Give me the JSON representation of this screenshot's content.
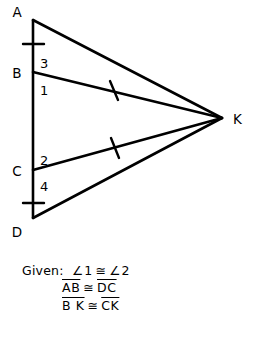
{
  "figure": {
    "vertices": [
      {
        "id": "A",
        "label": "A",
        "x": 33,
        "y": 20,
        "label_x": 17,
        "label_y": 17
      },
      {
        "id": "B",
        "label": "B",
        "x": 33,
        "y": 72,
        "label_x": 17,
        "label_y": 77
      },
      {
        "id": "C",
        "label": "C",
        "x": 33,
        "y": 170,
        "label_x": 17,
        "label_y": 175
      },
      {
        "id": "D",
        "label": "D",
        "x": 33,
        "y": 218,
        "label_x": 17,
        "label_y": 235
      },
      {
        "id": "K",
        "label": "K",
        "x": 222,
        "y": 118,
        "label_x": 233,
        "label_y": 123
      }
    ],
    "segments": [
      {
        "id": "AD",
        "from": "A",
        "to": "D",
        "x1": 33,
        "y1": 20,
        "x2": 33,
        "y2": 218
      },
      {
        "id": "AK",
        "from": "A",
        "to": "K",
        "x1": 33,
        "y1": 20,
        "x2": 222,
        "y2": 118
      },
      {
        "id": "BK",
        "from": "B",
        "to": "K",
        "x1": 33,
        "y1": 72,
        "x2": 222,
        "y2": 118
      },
      {
        "id": "CK",
        "from": "C",
        "to": "K",
        "x1": 33,
        "y1": 170,
        "x2": 222,
        "y2": 118
      },
      {
        "id": "DK",
        "from": "D",
        "to": "K",
        "x1": 33,
        "y1": 218,
        "x2": 222,
        "y2": 118
      }
    ],
    "tick_marks": [
      {
        "id": "tick-AB",
        "on_segment": "AB",
        "x1": 23,
        "y1": 44,
        "x2": 44,
        "y2": 44
      },
      {
        "id": "tick-CD",
        "on_segment": "CD",
        "x1": 23,
        "y1": 203,
        "x2": 44,
        "y2": 203
      },
      {
        "id": "tick-BK",
        "on_segment": "BK",
        "x1": 110,
        "y1": 82,
        "x2": 118,
        "y2": 99
      },
      {
        "id": "tick-CK",
        "on_segment": "CK",
        "x1": 111,
        "y1": 139,
        "x2": 119,
        "y2": 157
      }
    ],
    "angle_labels": [
      {
        "id": "angle-3",
        "label": "3",
        "x": 40,
        "y": 68
      },
      {
        "id": "angle-1",
        "label": "1",
        "x": 40,
        "y": 94
      },
      {
        "id": "angle-2",
        "label": "2",
        "x": 40,
        "y": 165
      },
      {
        "id": "angle-4",
        "label": "4",
        "x": 40,
        "y": 190
      }
    ],
    "stroke_color": "#000000"
  },
  "given": {
    "heading": "Given:",
    "line1": {
      "left_angle_symbol": "∠",
      "left": "1",
      "congruent": "≅",
      "right_angle_symbol": "∠",
      "right": "2"
    },
    "line2": {
      "left": "AB",
      "congruent": "≅",
      "right": "DC"
    },
    "line3": {
      "left": "B K",
      "congruent": "≅",
      "right": "CK"
    }
  }
}
